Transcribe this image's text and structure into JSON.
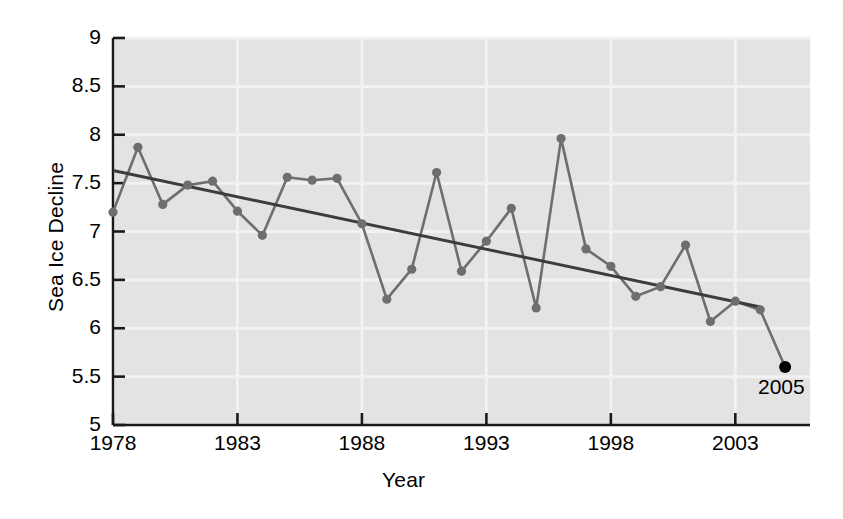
{
  "chart_data": {
    "type": "line",
    "title": "",
    "subtitle": "",
    "xlabel": "Year",
    "ylabel": "Sea Ice Decline",
    "xlim": [
      1978,
      2006
    ],
    "ylim": [
      5,
      9
    ],
    "xticks": [
      1978,
      1983,
      1988,
      1993,
      1998,
      2003
    ],
    "xticklabels": [
      "1978",
      "1983",
      "1988",
      "1993",
      "1998",
      "2003"
    ],
    "yticks": [
      5,
      5.5,
      6,
      6.5,
      7,
      7.5,
      8,
      8.5,
      9
    ],
    "yticklabels": [
      "5",
      "5.5",
      "6",
      "6.5",
      "7",
      "7.5",
      "8",
      "8.5",
      "9"
    ],
    "grid": true,
    "legend": "none",
    "x": [
      1978,
      1979,
      1980,
      1981,
      1982,
      1983,
      1984,
      1985,
      1986,
      1987,
      1988,
      1989,
      1990,
      1991,
      1992,
      1993,
      1994,
      1995,
      1996,
      1997,
      1998,
      1999,
      2000,
      2001,
      2002,
      2003,
      2004,
      2005
    ],
    "series": [
      {
        "name": "Sea Ice Extent",
        "color": "#6e6e6e",
        "marker": "circle",
        "values": [
          7.2,
          7.87,
          7.28,
          7.48,
          7.52,
          7.21,
          6.96,
          7.56,
          7.53,
          7.55,
          7.08,
          6.3,
          6.61,
          7.61,
          6.59,
          6.9,
          7.24,
          6.21,
          7.96,
          6.82,
          6.64,
          6.33,
          6.43,
          6.86,
          6.07,
          6.28,
          6.19,
          5.6
        ]
      }
    ],
    "trendline": {
      "name": "Linear trend",
      "color": "#3c3c3c",
      "x": [
        1978,
        2004
      ],
      "y": [
        7.63,
        6.22
      ]
    },
    "highlight_point": {
      "label": "2005",
      "x": 2005,
      "y": 5.6,
      "color": "#000000"
    },
    "style": {
      "plot_background": "#e3e3e3",
      "gridline_color": "#f2f2f2",
      "axis_color": "#1a1a1a",
      "text_color": "#000000"
    }
  }
}
